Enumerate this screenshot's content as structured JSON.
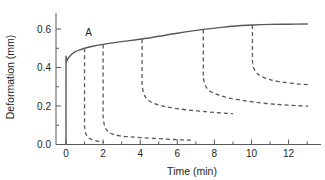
{
  "chart_data": {
    "type": "line",
    "title": "",
    "xlabel": "Time (min)",
    "ylabel": "Deformation (mm)",
    "xlim": [
      -0.55,
      13.2
    ],
    "ylim": [
      0.0,
      0.68
    ],
    "xticks": [
      0,
      2,
      4,
      6,
      8,
      10,
      12
    ],
    "xticklabels": [
      "0",
      "2",
      "4",
      "6",
      "8",
      "10",
      "12"
    ],
    "xminorticks": [
      1,
      3,
      5,
      7,
      9,
      11,
      13
    ],
    "yticks": [
      0.0,
      0.2,
      0.4,
      0.6
    ],
    "yticklabels": [
      "0.0",
      "0.2",
      "0.4",
      "0.6"
    ],
    "yminorticks": [
      0.1,
      0.3,
      0.5
    ],
    "grid": false,
    "legend": null,
    "annotations": [
      {
        "text": "A",
        "x": 1.0,
        "y": 0.565,
        "name": "point-a-label"
      }
    ],
    "series": [
      {
        "name": "creep-curve",
        "style": "solid",
        "x": [
          0.0,
          0.0,
          0.03,
          0.07,
          0.12,
          0.18,
          0.26,
          0.36,
          0.5,
          0.7,
          1.0,
          1.5,
          2.0,
          2.6,
          3.2,
          4.1,
          5.0,
          6.0,
          7.4,
          8.5,
          9.5,
          10.05,
          11.0,
          12.0,
          13.0
        ],
        "y": [
          0.0,
          0.425,
          0.432,
          0.44,
          0.448,
          0.456,
          0.464,
          0.473,
          0.482,
          0.49,
          0.5,
          0.512,
          0.52,
          0.529,
          0.537,
          0.548,
          0.562,
          0.578,
          0.598,
          0.61,
          0.618,
          0.621,
          0.624,
          0.625,
          0.626
        ]
      },
      {
        "name": "recovery-unload-1",
        "style": "dashed",
        "unload_time": 1.0,
        "x": [
          1.0,
          1.0,
          1.05,
          1.12,
          1.2,
          1.32,
          1.5,
          1.7,
          1.9,
          2.05
        ],
        "y": [
          0.5,
          0.09,
          0.062,
          0.045,
          0.036,
          0.029,
          0.022,
          0.017,
          0.014,
          0.012
        ]
      },
      {
        "name": "recovery-unload-2",
        "style": "dashed",
        "unload_time": 2.0,
        "x": [
          2.0,
          2.0,
          2.06,
          2.16,
          2.3,
          2.55,
          2.9,
          3.4,
          4.0,
          4.7,
          5.4,
          6.0,
          6.5,
          6.8
        ],
        "y": [
          0.52,
          0.145,
          0.105,
          0.08,
          0.065,
          0.053,
          0.045,
          0.04,
          0.036,
          0.032,
          0.028,
          0.025,
          0.023,
          0.022
        ]
      },
      {
        "name": "recovery-unload-3",
        "style": "dashed",
        "unload_time": 4.1,
        "x": [
          4.1,
          4.1,
          4.17,
          4.3,
          4.5,
          4.85,
          5.4,
          6.1,
          6.9,
          7.6,
          8.2,
          8.7,
          9.0
        ],
        "y": [
          0.548,
          0.31,
          0.27,
          0.245,
          0.226,
          0.21,
          0.196,
          0.185,
          0.176,
          0.17,
          0.165,
          0.162,
          0.16
        ]
      },
      {
        "name": "recovery-unload-4",
        "style": "dashed",
        "unload_time": 7.4,
        "x": [
          7.4,
          7.4,
          7.48,
          7.62,
          7.85,
          8.25,
          8.8,
          9.6,
          10.5,
          11.4,
          12.2,
          12.8,
          13.05
        ],
        "y": [
          0.598,
          0.35,
          0.315,
          0.29,
          0.272,
          0.256,
          0.241,
          0.228,
          0.216,
          0.208,
          0.203,
          0.2,
          0.199
        ]
      },
      {
        "name": "recovery-unload-5",
        "style": "dashed",
        "unload_time": 10.05,
        "x": [
          10.05,
          10.05,
          10.13,
          10.28,
          10.5,
          10.9,
          11.4,
          12.0,
          12.6,
          13.05
        ],
        "y": [
          0.621,
          0.43,
          0.395,
          0.372,
          0.355,
          0.34,
          0.328,
          0.32,
          0.314,
          0.311
        ]
      }
    ]
  },
  "axis": {
    "x_title": "Time (min)",
    "y_title": "Deformation (mm)"
  }
}
